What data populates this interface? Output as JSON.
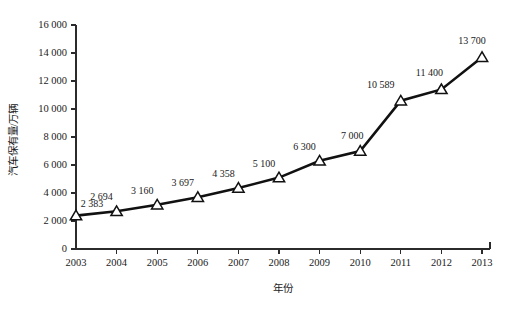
{
  "chart_data": {
    "type": "line",
    "title": "",
    "subtitle": "",
    "xlabel": "年份",
    "ylabel": "汽车保有量/万辆",
    "categories": [
      "2003",
      "2004",
      "2005",
      "2006",
      "2007",
      "2008",
      "2009",
      "2010",
      "2011",
      "2012",
      "2013"
    ],
    "x": [
      2003,
      2004,
      2005,
      2006,
      2007,
      2008,
      2009,
      2010,
      2011,
      2012,
      2013
    ],
    "values": [
      2383,
      2694,
      3160,
      3697,
      4358,
      5100,
      6300,
      7000,
      10589,
      11400,
      13700
    ],
    "point_labels": [
      "2 383",
      "2 694",
      "3 160",
      "3 697",
      "4 358",
      "5 100",
      "6 300",
      "7 000",
      "10 589",
      "11 400",
      "13 700"
    ],
    "series": [
      {
        "name": "汽车保有量",
        "values": [
          2383,
          2694,
          3160,
          3697,
          4358,
          5100,
          6300,
          7000,
          10589,
          11400,
          13700
        ],
        "marker": "triangle-hollow",
        "line_color": "#111111",
        "marker_fill": "#ffffff"
      }
    ],
    "ylim": [
      0,
      16000
    ],
    "ytick_values": [
      0,
      2000,
      4000,
      6000,
      8000,
      10000,
      12000,
      14000,
      16000
    ],
    "ytick_labels": [
      "0",
      "2 000",
      "4 000",
      "6 000",
      "8 000",
      "10 000",
      "12 000",
      "14 000",
      "16 000"
    ],
    "xtick_labels": [
      "2003",
      "2004",
      "2005",
      "2006",
      "2007",
      "2008",
      "2009",
      "2010",
      "2011",
      "2012",
      "2013"
    ],
    "grid": false,
    "legend": "none",
    "background_color": "#ffffff",
    "axis_color": "#2b2b2b",
    "data_labels_shown": true
  }
}
